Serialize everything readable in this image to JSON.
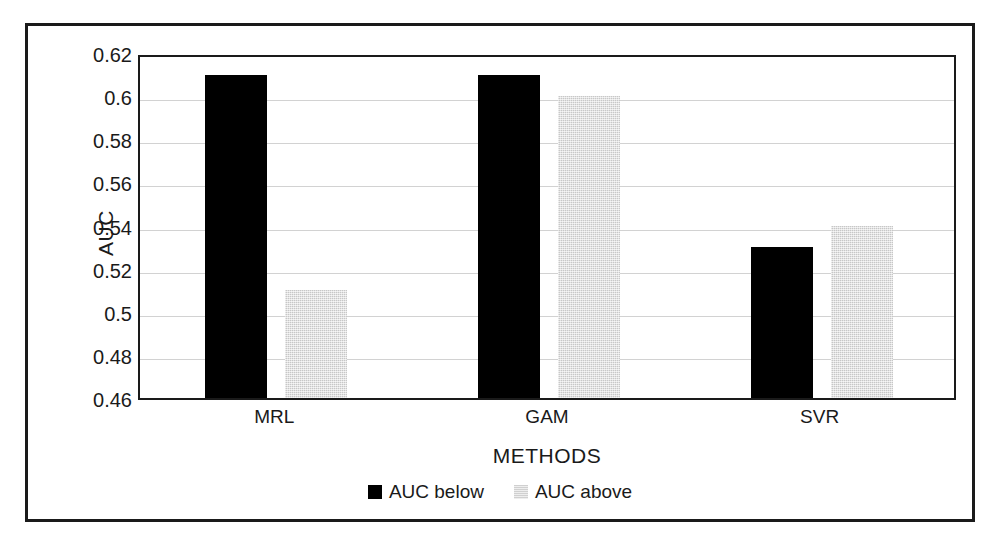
{
  "chart_data": {
    "type": "bar",
    "title": "",
    "xlabel": "METHODS",
    "ylabel": "AUC",
    "categories": [
      "MRL",
      "GAM",
      "SVR"
    ],
    "series": [
      {
        "name": "AUC below",
        "values": [
          0.61,
          0.61,
          0.53
        ],
        "color": "#000000"
      },
      {
        "name": "AUC above",
        "values": [
          0.51,
          0.6,
          0.54
        ],
        "color": "#d9d9d9"
      }
    ],
    "ylim": [
      0.46,
      0.62
    ],
    "ytick_step": 0.02,
    "ytick_labels": [
      "0.62",
      "0.6",
      "0.58",
      "0.56",
      "0.54",
      "0.52",
      "0.5",
      "0.48",
      "0.46"
    ],
    "ytick_values": [
      0.62,
      0.6,
      0.58,
      0.56,
      0.54,
      0.52,
      0.5,
      0.48,
      0.46
    ],
    "grid": true,
    "legend_position": "bottom",
    "gridline_color": "#d2d2d2",
    "axis_color": "#1a1a1a",
    "frame_color": "#1a1a1a"
  },
  "legend": {
    "items": [
      {
        "label": "AUC below",
        "swatch": "black-square-swatch"
      },
      {
        "label": "AUC above",
        "swatch": "gray-square-swatch"
      }
    ]
  }
}
